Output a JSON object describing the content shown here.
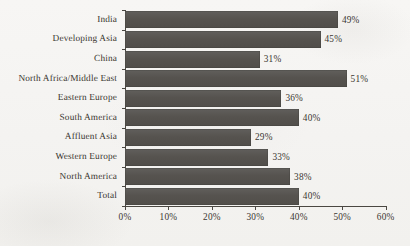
{
  "chart_data": {
    "type": "bar",
    "orientation": "horizontal",
    "title": "",
    "subtitle": "",
    "xlabel": "",
    "ylabel": "",
    "categories": [
      "India",
      "Developing Asia",
      "China",
      "North Africa/Middle East",
      "Eastern Europe",
      "South America",
      "Affluent Asia",
      "Western Europe",
      "North America",
      "Total"
    ],
    "values": [
      49,
      45,
      31,
      51,
      36,
      40,
      29,
      33,
      38,
      40
    ],
    "value_labels": [
      "49%",
      "45%",
      "31%",
      "51%",
      "36%",
      "40%",
      "29%",
      "33%",
      "38%",
      "40%"
    ],
    "xlim": [
      0,
      60
    ],
    "xticks": [
      0,
      10,
      20,
      30,
      40,
      50,
      60
    ],
    "xtick_labels": [
      "0%",
      "10%",
      "20%",
      "30%",
      "40%",
      "50%",
      "60%"
    ],
    "grid": false,
    "legend": null,
    "bar_color": "#56534f",
    "text_color": "#3a3630",
    "axis_color": "#4a4742",
    "background_color": "#f6f5f3"
  }
}
